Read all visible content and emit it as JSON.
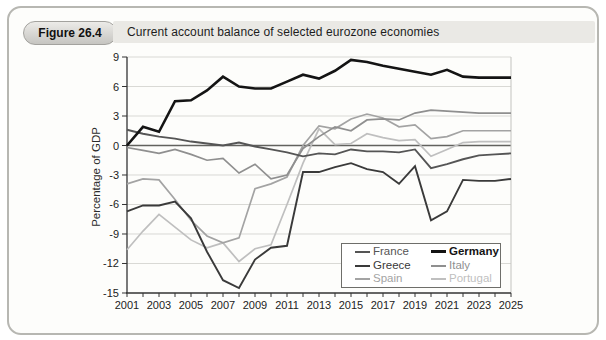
{
  "figure": {
    "badge": "Figure 26.4",
    "title": "Current account balance of selected eurozone economies"
  },
  "chart_data": {
    "type": "line",
    "title": "Current account balance of selected eurozone economies",
    "xlabel": "",
    "ylabel": "Percentage of GDP",
    "unit": "% of GDP",
    "xlim": [
      2001,
      2025
    ],
    "ylim": [
      -15,
      9
    ],
    "y_ticks": [
      9,
      6,
      3,
      0,
      -3,
      -6,
      -9,
      -12,
      -15
    ],
    "x_tick_labels": [
      "2001",
      "2003",
      "2005",
      "2007",
      "2009",
      "2011",
      "2013",
      "2015",
      "2017",
      "2019",
      "2021",
      "2023",
      "2025"
    ],
    "x_minor_tick_step": 1,
    "grid": "horizontal light gridlines; dark zero line",
    "legend_position": "inside bottom-right, two columns",
    "years": [
      2001,
      2002,
      2003,
      2004,
      2005,
      2006,
      2007,
      2008,
      2009,
      2010,
      2011,
      2012,
      2013,
      2014,
      2015,
      2016,
      2017,
      2018,
      2019,
      2020,
      2021,
      2022,
      2023,
      2024,
      2025
    ],
    "series": [
      {
        "name": "France",
        "color": "#555555",
        "width": 1.9,
        "bold": false,
        "values": [
          1.6,
          1.2,
          0.9,
          0.7,
          0.4,
          0.2,
          0.0,
          0.3,
          -0.1,
          -0.4,
          -0.7,
          -1.1,
          -0.8,
          -0.9,
          -0.4,
          -0.6,
          -0.6,
          -0.7,
          -0.4,
          -2.3,
          -1.9,
          -1.4,
          -1.0,
          -0.9,
          -0.8
        ]
      },
      {
        "name": "Germany",
        "color": "#141414",
        "width": 2.6,
        "bold": true,
        "values": [
          0.0,
          1.9,
          1.4,
          4.5,
          4.6,
          5.6,
          7.0,
          6.0,
          5.8,
          5.8,
          6.5,
          7.2,
          6.8,
          7.6,
          8.7,
          8.5,
          8.1,
          7.8,
          7.5,
          7.2,
          7.7,
          7.0,
          6.9,
          6.9,
          6.9
        ]
      },
      {
        "name": "Greece",
        "color": "#3a3a3a",
        "width": 1.9,
        "bold": false,
        "values": [
          -6.7,
          -6.1,
          -6.1,
          -5.7,
          -7.4,
          -10.8,
          -13.7,
          -14.5,
          -11.6,
          -10.4,
          -10.2,
          -2.7,
          -2.7,
          -2.2,
          -1.8,
          -2.4,
          -2.7,
          -3.9,
          -2.1,
          -7.6,
          -6.7,
          -3.5,
          -3.6,
          -3.6,
          -3.4
        ]
      },
      {
        "name": "Italy",
        "color": "#8f8f8f",
        "width": 1.7,
        "bold": false,
        "values": [
          -0.2,
          -0.5,
          -0.8,
          -0.4,
          -0.9,
          -1.5,
          -1.3,
          -2.8,
          -1.9,
          -3.4,
          -3.0,
          -0.3,
          0.9,
          1.9,
          1.5,
          2.6,
          2.7,
          2.6,
          3.3,
          3.6,
          3.5,
          3.4,
          3.3,
          3.3,
          3.3
        ]
      },
      {
        "name": "Spain",
        "color": "#a3a3a3",
        "width": 1.7,
        "bold": false,
        "values": [
          -3.9,
          -3.4,
          -3.5,
          -5.5,
          -7.6,
          -9.2,
          -9.9,
          -9.4,
          -4.4,
          -3.9,
          -3.2,
          0.0,
          2.0,
          1.7,
          2.7,
          3.2,
          2.8,
          1.9,
          2.1,
          0.7,
          0.9,
          1.5,
          1.5,
          1.5,
          1.5
        ]
      },
      {
        "name": "Portugal",
        "color": "#bfbfbf",
        "width": 1.7,
        "bold": false,
        "values": [
          -10.6,
          -8.7,
          -7.0,
          -8.3,
          -9.6,
          -10.4,
          -9.9,
          -11.8,
          -10.5,
          -10.1,
          -6.0,
          -1.8,
          1.7,
          0.1,
          0.2,
          1.2,
          0.8,
          0.5,
          0.6,
          -1.1,
          -0.4,
          0.3,
          0.4,
          0.4,
          0.4
        ]
      }
    ],
    "colors": {
      "grid": "#d9d9d5",
      "zero_line": "#62625e",
      "axis": "#333333",
      "frame": "#c3c3bf",
      "tick_text": "#222222"
    }
  }
}
